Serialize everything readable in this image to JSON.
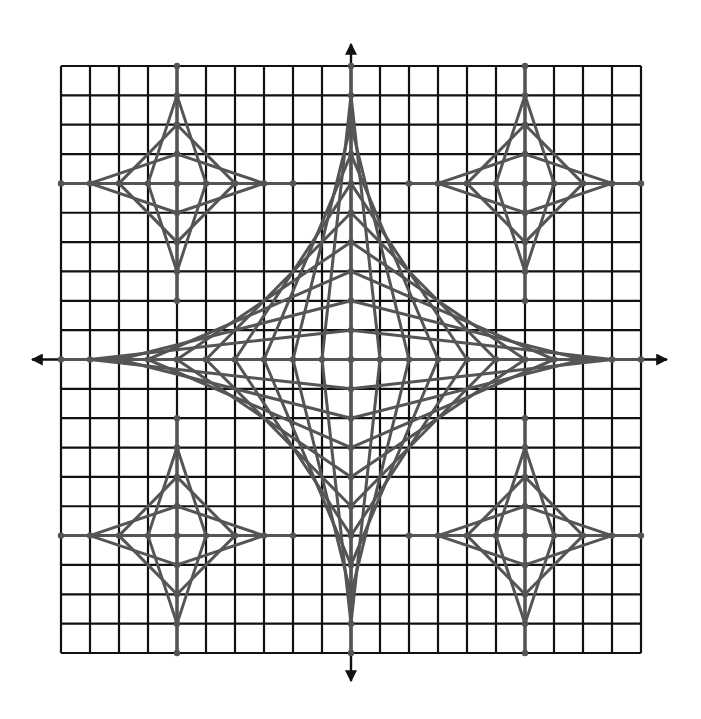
{
  "figure": {
    "grid": {
      "min": -10,
      "max": 10,
      "step": 1,
      "line_color": "#111111"
    },
    "axes": {
      "color": "#111111",
      "arrows": true
    },
    "stars": [
      {
        "name": "center-star",
        "cx": 0,
        "cy": 0,
        "radius": 10
      },
      {
        "name": "top-left-star",
        "cx": -6,
        "cy": 6,
        "radius": 4
      },
      {
        "name": "top-right-star",
        "cx": 6,
        "cy": 6,
        "radius": 4
      },
      {
        "name": "bottom-left-star",
        "cx": -6,
        "cy": -6,
        "radius": 4
      },
      {
        "name": "bottom-right-star",
        "cx": 6,
        "cy": -6,
        "radius": 4
      }
    ],
    "string_color": "#555555",
    "point_color": "#555555"
  }
}
